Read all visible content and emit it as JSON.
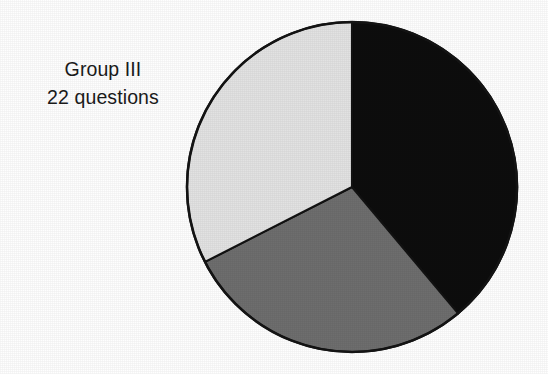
{
  "figure": {
    "background_color": "#fefefe",
    "outline_color": "#141414"
  },
  "label": {
    "line1": "Group III",
    "line2": "22 questions",
    "text_color": "#1b1b1b"
  },
  "chart_data": {
    "type": "pie",
    "title": "Group III",
    "subtitle": "22 questions",
    "xlabel": "",
    "ylabel": "",
    "grid": false,
    "legend": "none",
    "total_questions": 22,
    "start_angle_deg": 0,
    "direction": "clockwise",
    "center": {
      "x": 352,
      "y": 187,
      "r": 165
    },
    "categories": [
      "Slice 1",
      "Slice 2",
      "Slice 3"
    ],
    "values": [
      39,
      29,
      32
    ],
    "slices": [
      {
        "name": "Slice 1",
        "color": "#0d0d0d",
        "shade": "black",
        "percent": 39,
        "start_angle_deg": 0,
        "end_angle_deg": 140
      },
      {
        "name": "Slice 2",
        "color": "#6e6e6e",
        "shade": "medium-gray",
        "percent": 29,
        "start_angle_deg": 140,
        "end_angle_deg": 243
      },
      {
        "name": "Slice 3",
        "color": "#e2e2e2",
        "shade": "light-gray",
        "percent": 32,
        "start_angle_deg": 243,
        "end_angle_deg": 360
      }
    ]
  }
}
